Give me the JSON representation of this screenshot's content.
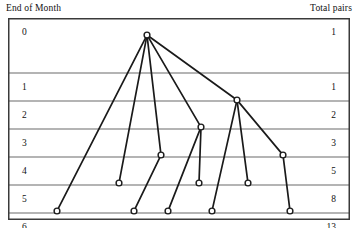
{
  "figure": {
    "title_left": "End of Month",
    "title_right": "Total pairs"
  },
  "chart_data": {
    "type": "diagram",
    "title": "",
    "xlabel": "",
    "ylabel": "End of Month",
    "grid": true,
    "legend_position": "none",
    "months": [
      0,
      1,
      2,
      3,
      4,
      5,
      6
    ],
    "total_pairs": [
      1,
      1,
      2,
      3,
      5,
      8,
      13
    ],
    "row_labels_left": [
      "0",
      "1",
      "2",
      "3",
      "4",
      "5",
      "6"
    ],
    "row_labels_right": [
      "1",
      "1",
      "2",
      "3",
      "5",
      "8",
      "13"
    ],
    "row_y": [
      27,
      55,
      83,
      111,
      139,
      167,
      195
    ],
    "nodes": [
      {
        "id": "n0",
        "month": 0,
        "x": 139,
        "y": 17
      },
      {
        "id": "n2",
        "month": 2,
        "x": 229,
        "y": 82
      },
      {
        "id": "n3",
        "month": 3,
        "x": 193,
        "y": 109
      },
      {
        "id": "n4a",
        "month": 4,
        "x": 153,
        "y": 137
      },
      {
        "id": "n4b",
        "month": 4,
        "x": 275,
        "y": 137
      },
      {
        "id": "n5a",
        "month": 5,
        "x": 111,
        "y": 165
      },
      {
        "id": "n5b",
        "month": 5,
        "x": 191,
        "y": 165
      },
      {
        "id": "n5c",
        "month": 5,
        "x": 240,
        "y": 165
      },
      {
        "id": "n6a",
        "month": 6,
        "x": 49,
        "y": 193
      },
      {
        "id": "n6b",
        "month": 6,
        "x": 126,
        "y": 193
      },
      {
        "id": "n6c",
        "month": 6,
        "x": 160,
        "y": 193
      },
      {
        "id": "n6d",
        "month": 6,
        "x": 204,
        "y": 193
      },
      {
        "id": "n6e",
        "month": 6,
        "x": 282,
        "y": 193
      }
    ],
    "edges": [
      {
        "from": "n0",
        "to": "n2"
      },
      {
        "from": "n0",
        "to": "n3"
      },
      {
        "from": "n0",
        "to": "n4a"
      },
      {
        "from": "n0",
        "to": "n5a"
      },
      {
        "from": "n0",
        "to": "n6a"
      },
      {
        "from": "n2",
        "to": "n4b"
      },
      {
        "from": "n2",
        "to": "n5c"
      },
      {
        "from": "n2",
        "to": "n6d"
      },
      {
        "from": "n3",
        "to": "n5b"
      },
      {
        "from": "n3",
        "to": "n6c"
      },
      {
        "from": "n4a",
        "to": "n6b"
      },
      {
        "from": "n4b",
        "to": "n6e"
      }
    ],
    "style": {
      "line_color": "#1a1a1a",
      "grid_color": "#6b6b6b",
      "border_color": "#3a3a3a",
      "node_fill": "#ffffff",
      "background": "#ffffff"
    }
  }
}
